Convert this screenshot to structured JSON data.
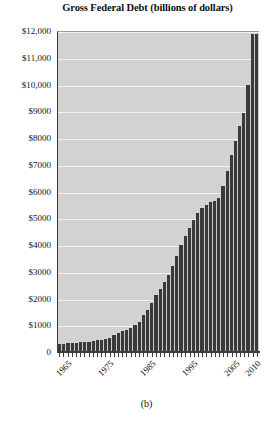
{
  "chart_data": {
    "type": "bar",
    "title": "Gross Federal Debt (billions of dollars)",
    "subtitle": "",
    "xlabel": "",
    "ylabel": "",
    "ylim": [
      0,
      12000
    ],
    "grid": true,
    "legend": null,
    "panel_label": "(b)",
    "y_ticks": [
      0,
      1000,
      2000,
      3000,
      4000,
      5000,
      6000,
      7000,
      8000,
      9000,
      10000,
      11000,
      12000
    ],
    "y_tick_labels": [
      "0",
      "$1000",
      "$2000",
      "$3000",
      "$4000",
      "$5000",
      "$6000",
      "$7000",
      "$8000",
      "$9000",
      "$10,000",
      "$11,000",
      "$12,000"
    ],
    "x_tick_labels": [
      "1965",
      "1975",
      "1985",
      "1995",
      "2005",
      "2010"
    ],
    "x_tick_years": [
      1965,
      1975,
      1985,
      1995,
      2005,
      2010
    ],
    "categories": [
      1963,
      1964,
      1965,
      1966,
      1967,
      1968,
      1969,
      1970,
      1971,
      1972,
      1973,
      1974,
      1975,
      1976,
      1977,
      1978,
      1979,
      1980,
      1981,
      1982,
      1983,
      1984,
      1985,
      1986,
      1987,
      1988,
      1989,
      1990,
      1991,
      1992,
      1993,
      1994,
      1995,
      1996,
      1997,
      1998,
      1999,
      2000,
      2001,
      2002,
      2003,
      2004,
      2005,
      2006,
      2007,
      2008,
      2009,
      2010
    ],
    "values": [
      310,
      316,
      322,
      329,
      341,
      370,
      367,
      381,
      408,
      436,
      466,
      484,
      542,
      629,
      706,
      777,
      829,
      909,
      995,
      1137,
      1372,
      1565,
      1818,
      2120,
      2346,
      2601,
      2868,
      3206,
      3598,
      4002,
      4351,
      4643,
      4921,
      5181,
      5369,
      5478,
      5606,
      5629,
      5770,
      6198,
      6760,
      7355,
      7905,
      8451,
      8951,
      9986,
      11876,
      11900
    ],
    "bar_color": "#3a3a3a",
    "plot_background": "#d2d2d2",
    "gridline_color": "#f2f2f2",
    "axis_color": "#3c3c3c"
  }
}
